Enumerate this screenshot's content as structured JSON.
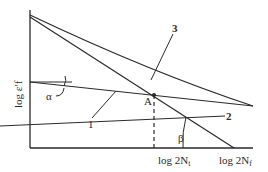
{
  "diagram": {
    "y_axis_label": "log ε′f",
    "x_tick_labels": [
      {
        "main": "log 2N",
        "sub": "t"
      },
      {
        "main": "log 2N",
        "sub": "f"
      }
    ],
    "curve_labels": [
      "1",
      "2",
      "3"
    ],
    "point_label": "A",
    "angle_labels": {
      "alpha": "α",
      "beta": "β"
    },
    "colors": {
      "line": "#2a2a2a",
      "background": "#ffffff"
    }
  }
}
